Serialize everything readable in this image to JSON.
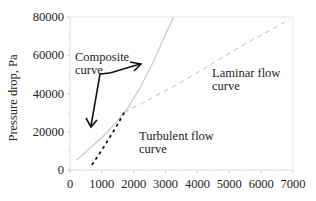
{
  "chart_data": {
    "type": "line",
    "title": "",
    "xlabel": "",
    "ylabel": "Pressure drop, Pa",
    "xlim": [
      0,
      7000
    ],
    "ylim": [
      0,
      80000
    ],
    "xticks": [
      0,
      1000,
      2000,
      3000,
      4000,
      5000,
      6000,
      7000
    ],
    "yticks": [
      0,
      20000,
      40000,
      60000,
      80000
    ],
    "xtick_labels": [
      "0",
      "1000",
      "2000",
      "3000",
      "4000",
      "5000",
      "6000",
      "7000"
    ],
    "ytick_labels": [
      "0",
      "20000",
      "40000",
      "60000",
      "80000"
    ],
    "grid": false,
    "series": [
      {
        "name": "Composite curve",
        "style": "solid",
        "color": "#c8c8c8",
        "x": [
          200,
          600,
          1000,
          1400,
          1800,
          2200,
          2600,
          3000,
          3250
        ],
        "y": [
          5000,
          11000,
          17000,
          24000,
          32000,
          43000,
          56000,
          71000,
          80000
        ]
      },
      {
        "name": "Laminar flow curve",
        "style": "dashed",
        "color": "#d0d0d0",
        "x": [
          1700,
          2500,
          3500,
          4500,
          5500,
          6500,
          6900
        ],
        "y": [
          30000,
          37000,
          46000,
          56000,
          66000,
          75000,
          79000
        ]
      },
      {
        "name": "Turbulent flow curve",
        "style": "dotted",
        "color": "#111111",
        "x": [
          700,
          900,
          1100,
          1300,
          1500,
          1700
        ],
        "y": [
          3000,
          8000,
          13000,
          18500,
          24000,
          30000
        ]
      }
    ],
    "annotations": [
      {
        "text_lines": [
          "Composite",
          "curve"
        ],
        "x": 700,
        "y": 60000
      },
      {
        "text_lines": [
          "Laminar flow",
          "curve"
        ],
        "x": 4000,
        "y": 45000
      },
      {
        "text_lines": [
          "Turbulent flow",
          "curve"
        ],
        "x": 1800,
        "y": 14000
      }
    ]
  }
}
